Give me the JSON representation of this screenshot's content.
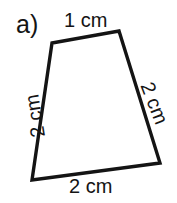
{
  "figure": {
    "part_label": "a)",
    "background_color": "#ffffff",
    "ink_color": "#141414",
    "stroke_width": 3.2
  },
  "shape": {
    "name": "trapezoid",
    "sides": 4,
    "vertices": [
      {
        "name": "top-left",
        "x": 52,
        "y": 43
      },
      {
        "name": "top-right",
        "x": 119,
        "y": 31
      },
      {
        "name": "bottom-right",
        "x": 160,
        "y": 163
      },
      {
        "name": "bottom-left",
        "x": 32,
        "y": 180
      }
    ],
    "path": "M 52 43 L 119 31 L 160 163 L 32 180 Z"
  },
  "side_labels": {
    "top": "1 cm",
    "right": "2 cm",
    "bottom": "2 cm",
    "left": "2 cm"
  }
}
